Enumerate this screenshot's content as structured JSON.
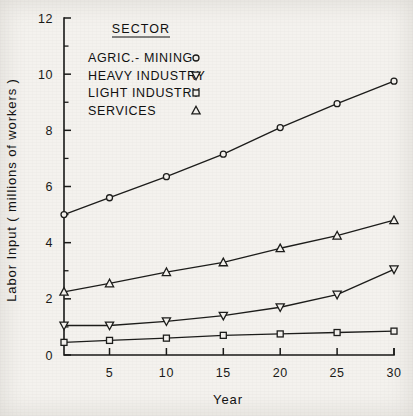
{
  "chart_data": {
    "type": "line",
    "title": "",
    "xlabel": "Year",
    "ylabel": "Labor Input ( millions of workers )",
    "xlim": [
      1,
      30
    ],
    "ylim": [
      0,
      12
    ],
    "grid": false,
    "legend_position": "upper-left-inside",
    "legend_title": "SECTOR",
    "x": [
      1,
      5,
      10,
      15,
      20,
      25,
      30
    ],
    "x_tick_labels": [
      "5",
      "10",
      "15",
      "20",
      "25",
      "30"
    ],
    "x_tick_values": [
      5,
      10,
      15,
      20,
      25,
      30
    ],
    "y_tick_labels": [
      "0",
      "2",
      "4",
      "6",
      "8",
      "10",
      "12"
    ],
    "y_tick_values": [
      0,
      2,
      4,
      6,
      8,
      10,
      12
    ],
    "y_minor_tick_values": [
      1,
      3,
      5,
      7,
      9,
      11
    ],
    "series": [
      {
        "name": "AGRIC.- MINING",
        "marker": "circle",
        "values": [
          5.0,
          5.6,
          6.35,
          7.15,
          8.1,
          8.95,
          9.75
        ]
      },
      {
        "name": "HEAVY INDUSTRY",
        "marker": "triangle-down",
        "values": [
          1.05,
          1.05,
          1.2,
          1.4,
          1.7,
          2.15,
          3.05
        ]
      },
      {
        "name": "LIGHT INDUSTRY",
        "marker": "square",
        "values": [
          0.45,
          0.52,
          0.6,
          0.7,
          0.75,
          0.8,
          0.85
        ]
      },
      {
        "name": "SERVICES",
        "marker": "triangle-up",
        "values": [
          2.25,
          2.55,
          2.95,
          3.3,
          3.8,
          4.25,
          4.8
        ]
      }
    ],
    "colors": {
      "ink": "#1d1d1b",
      "paper": "#f4f2ee"
    }
  }
}
